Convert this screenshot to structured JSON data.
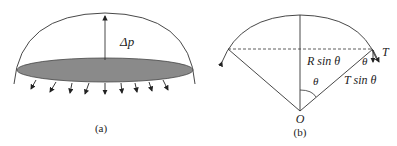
{
  "panel_a": {
    "caption": "(a)",
    "pressure_label": "Δp",
    "membrane_fill": "#8a8a8a",
    "arrow_count": 9
  },
  "panel_b": {
    "caption": "(b)",
    "origin_label": "O",
    "angle_label_center": "θ",
    "angle_label_edge": "θ",
    "tension_label": "T",
    "radius_component_label": "R sin θ",
    "tension_component_label": "T sin θ"
  },
  "colors": {
    "line": "#333333",
    "membrane": "#8a8a8a",
    "background": "#ffffff"
  }
}
